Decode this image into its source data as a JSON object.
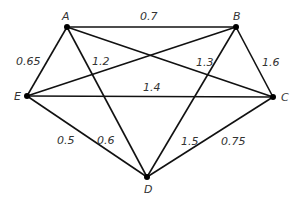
{
  "graph": {
    "nodes": [
      {
        "id": "A",
        "x": 67,
        "y": 27,
        "lx": 62,
        "ly": 20
      },
      {
        "id": "B",
        "x": 236,
        "y": 27,
        "lx": 233,
        "ly": 20
      },
      {
        "id": "C",
        "x": 273,
        "y": 97,
        "lx": 281,
        "ly": 101
      },
      {
        "id": "D",
        "x": 147,
        "y": 177,
        "lx": 144,
        "ly": 193
      },
      {
        "id": "E",
        "x": 27,
        "y": 96,
        "lx": 14,
        "ly": 100
      }
    ],
    "edges": [
      {
        "from": "A",
        "to": "B",
        "weight": "0.7",
        "lx": 140,
        "ly": 20
      },
      {
        "from": "A",
        "to": "E",
        "weight": "0.65",
        "lx": 16,
        "ly": 65
      },
      {
        "from": "A",
        "to": "D",
        "weight": "1.2",
        "lx": 92,
        "ly": 65
      },
      {
        "from": "A",
        "to": "C",
        "weight": "1.3",
        "lx": 196,
        "ly": 66
      },
      {
        "from": "B",
        "to": "E",
        "weight": "",
        "lx": 0,
        "ly": 0
      },
      {
        "from": "B",
        "to": "C",
        "weight": "1.6",
        "lx": 262,
        "ly": 66
      },
      {
        "from": "B",
        "to": "D",
        "weight": "1.5",
        "lx": 181,
        "ly": 145
      },
      {
        "from": "E",
        "to": "C",
        "weight": "1.4",
        "lx": 143,
        "ly": 91
      },
      {
        "from": "E",
        "to": "D",
        "weight": "0.5",
        "lx": 57,
        "ly": 144
      },
      {
        "from": "C",
        "to": "D",
        "weight": "0.75",
        "lx": 221,
        "ly": 145
      },
      {
        "from": "D",
        "to": "E2",
        "weight": "0.6",
        "lx": 97,
        "ly": 144
      }
    ]
  }
}
